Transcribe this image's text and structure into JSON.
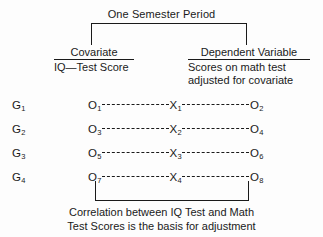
{
  "figure": {
    "top_label": "One Semester Period",
    "columns": {
      "covariate": {
        "title": "Covariate",
        "subtitle": "IQ—Test Score"
      },
      "dependent": {
        "title": "Dependent Variable",
        "subtitle_line1": "Scores on math test",
        "subtitle_line2": "adjusted for covariate"
      }
    },
    "rows": [
      {
        "group": "G",
        "group_sub": "1",
        "pre": "O",
        "pre_sub": "1",
        "treatment": "X",
        "treatment_sub": "1",
        "post": "O",
        "post_sub": "2"
      },
      {
        "group": "G",
        "group_sub": "2",
        "pre": "O",
        "pre_sub": "3",
        "treatment": "X",
        "treatment_sub": "2",
        "post": "O",
        "post_sub": "4"
      },
      {
        "group": "G",
        "group_sub": "3",
        "pre": "O",
        "pre_sub": "5",
        "treatment": "X",
        "treatment_sub": "3",
        "post": "O",
        "post_sub": "6"
      },
      {
        "group": "G",
        "group_sub": "4",
        "pre": "O",
        "pre_sub": "7",
        "treatment": "X",
        "treatment_sub": "4",
        "post": "O",
        "post_sub": "8"
      }
    ],
    "caption_line1": "Correlation between IQ Test and Math",
    "caption_line2": "Test Scores is the basis for adjustment",
    "ink_color": "#1a1a1a",
    "background_color": "#fdfdfd"
  }
}
